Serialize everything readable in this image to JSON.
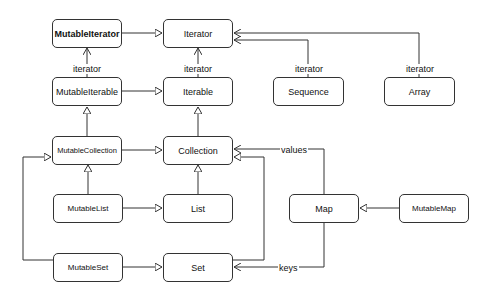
{
  "nodes": {
    "mutable_iterator": "MutableIterator",
    "iterator": "Iterator",
    "mutable_iterable": "MutableIterable",
    "iterable": "Iterable",
    "sequence": "Sequence",
    "array": "Array",
    "mutable_collection": "MutableCollection",
    "collection": "Collection",
    "mutable_list": "MutableList",
    "list": "List",
    "map": "Map",
    "mutable_map": "MutableMap",
    "mutable_set": "MutableSet",
    "set": "Set"
  },
  "edge_labels": {
    "mutable_iterable_iterator": "iterator",
    "iterable_iterator": "iterator",
    "sequence_iterator": "iterator",
    "array_iterator": "iterator",
    "map_values": "values",
    "map_keys": "keys"
  },
  "colors": {
    "line": "#333333",
    "background": "#ffffff"
  }
}
